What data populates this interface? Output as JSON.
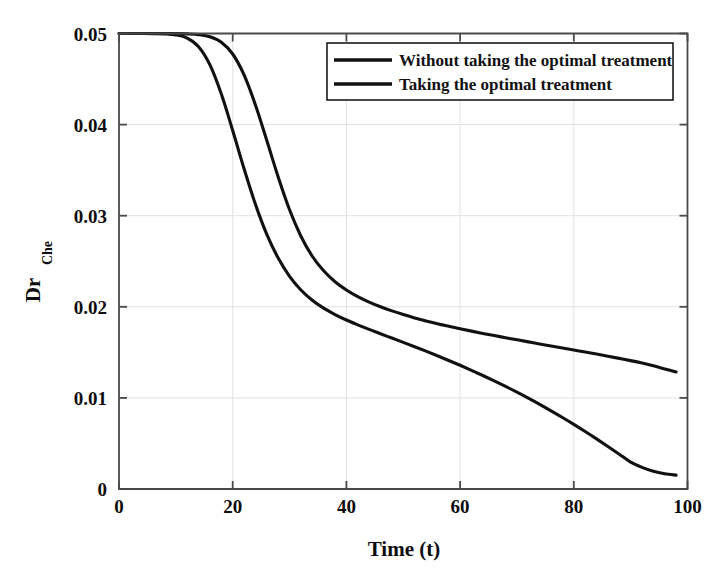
{
  "chart_data": {
    "type": "line",
    "title": "",
    "xlabel": "Time (t)",
    "ylabel": "Dr",
    "ylabel_sub": "Che",
    "xlim": [
      0,
      100
    ],
    "ylim": [
      0,
      0.05
    ],
    "xticks": [
      0,
      20,
      40,
      60,
      80,
      100
    ],
    "xtick_labels": [
      "0",
      "20",
      "40",
      "60",
      "80",
      "100"
    ],
    "yticks": [
      0,
      0.01,
      0.02,
      0.03,
      0.04,
      0.05
    ],
    "ytick_labels": [
      "0",
      "0.01",
      "0.02",
      "0.03",
      "0.04",
      "0.05"
    ],
    "grid": true,
    "legend_position": "top-right",
    "line_color": "#111111",
    "grid_color": "#e2e2e2",
    "axis_color": "#4a4a4a",
    "series": [
      {
        "name": "Without taking the optimal treatment",
        "x": [
          0,
          2,
          4,
          6,
          8,
          10,
          12,
          14,
          16,
          18,
          20,
          22,
          24,
          26,
          28,
          30,
          32,
          34,
          36,
          38,
          40,
          42,
          44,
          46,
          48,
          50,
          52,
          54,
          56,
          58,
          60,
          62,
          64,
          66,
          68,
          70,
          72,
          74,
          76,
          78,
          80,
          82,
          84,
          86,
          88,
          90,
          92,
          94,
          96,
          98
        ],
        "y": [
          0.05,
          0.05,
          0.05,
          0.05,
          0.05,
          0.04999,
          0.04996,
          0.04988,
          0.04965,
          0.04905,
          0.04775,
          0.04545,
          0.04215,
          0.03825,
          0.03425,
          0.03065,
          0.02775,
          0.02555,
          0.02395,
          0.02275,
          0.02185,
          0.02112,
          0.02052,
          0.02,
          0.01955,
          0.01915,
          0.01878,
          0.01845,
          0.01814,
          0.01786,
          0.01759,
          0.01733,
          0.01708,
          0.01684,
          0.01661,
          0.01638,
          0.01615,
          0.01592,
          0.0157,
          0.01548,
          0.01526,
          0.01504,
          0.01481,
          0.01458,
          0.01434,
          0.01409,
          0.01382,
          0.01352,
          0.01318,
          0.01285
        ]
      },
      {
        "name": "Taking the optimal treatment",
        "x": [
          0,
          2,
          4,
          6,
          8,
          10,
          12,
          14,
          16,
          18,
          20,
          22,
          24,
          26,
          28,
          30,
          32,
          34,
          36,
          38,
          40,
          42,
          44,
          46,
          48,
          50,
          52,
          54,
          56,
          58,
          60,
          62,
          64,
          66,
          68,
          70,
          72,
          74,
          76,
          78,
          80,
          82,
          84,
          86,
          88,
          90,
          92,
          94,
          96,
          98
        ],
        "y": [
          0.05,
          0.05,
          0.05,
          0.04999,
          0.04996,
          0.04985,
          0.0495,
          0.04855,
          0.04655,
          0.04335,
          0.03935,
          0.03515,
          0.03125,
          0.02795,
          0.02535,
          0.02335,
          0.02185,
          0.02072,
          0.01985,
          0.01915,
          0.01855,
          0.01802,
          0.01752,
          0.01704,
          0.01657,
          0.0161,
          0.01562,
          0.01513,
          0.01463,
          0.01411,
          0.01358,
          0.01303,
          0.01246,
          0.01187,
          0.01126,
          0.01063,
          0.00997,
          0.00929,
          0.00858,
          0.00785,
          0.00709,
          0.00631,
          0.0055,
          0.00467,
          0.00382,
          0.00295,
          0.00238,
          0.00195,
          0.00168,
          0.00152
        ]
      }
    ]
  },
  "legend": {
    "entries": [
      {
        "label": "Without taking the optimal treatment"
      },
      {
        "label": "Taking the optimal treatment"
      }
    ]
  }
}
